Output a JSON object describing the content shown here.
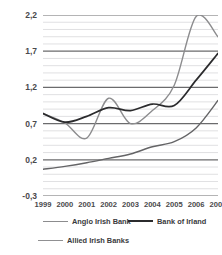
{
  "chart_data": {
    "type": "line",
    "title": "",
    "subtitle": "",
    "xlabel": "",
    "ylabel": "",
    "x": [
      1999,
      2000,
      2001,
      2002,
      2003,
      2004,
      2005,
      2006,
      2007
    ],
    "x_tick_labels": [
      "1999",
      "2000",
      "2001",
      "2002",
      "2003",
      "2004",
      "2005",
      "2006",
      "2007"
    ],
    "y_tick_labels": [
      "2,2",
      "1,7",
      "1,2",
      "0,7",
      "0,2",
      "-0,3"
    ],
    "y_tick_values": [
      2.2,
      1.7,
      1.2,
      0.7,
      0.2,
      -0.3
    ],
    "ylim": [
      -0.3,
      2.2
    ],
    "xlim": [
      1999,
      2007
    ],
    "grid": "horizontal-major-and-minor",
    "minor_grid_step": 0.1,
    "legend_position": "bottom",
    "series": [
      {
        "name": "Anglo Irish Bank",
        "color": "#8c8c8e",
        "width": 1.4,
        "values": [
          0.84,
          0.71,
          0.5,
          1.05,
          0.7,
          0.88,
          1.23,
          2.18,
          1.9
        ]
      },
      {
        "name": "Bank of Irland",
        "color": "#2b2b2d",
        "width": 1.7,
        "values": [
          0.84,
          0.72,
          0.8,
          0.92,
          0.88,
          0.97,
          0.95,
          1.3,
          1.67
        ]
      },
      {
        "name": "Allied Irish Banks",
        "color": "#646466",
        "width": 1.4,
        "values": [
          0.07,
          0.11,
          0.16,
          0.22,
          0.28,
          0.38,
          0.45,
          0.64,
          1.02
        ]
      }
    ]
  },
  "axis": {
    "y_label_0": "2,2",
    "y_label_1": "1,7",
    "y_label_2": "1,2",
    "y_label_3": "0,7",
    "y_label_4": "0,2",
    "y_label_5": "-0,3"
  },
  "legend": {
    "items": [
      {
        "label": "Anglo Irish Bank",
        "color": "#8c8c8e",
        "width": 1.6
      },
      {
        "label": "Bank of Irland",
        "color": "#2b2b2d",
        "width": 2.0
      },
      {
        "label": "Allied Irish Banks",
        "color": "#909092",
        "width": 1.4
      }
    ]
  },
  "style": {
    "background": "#ffffff",
    "major_gridline": "#6b6b6d",
    "minor_gridline": "#d8d8da",
    "text": "#4a4a4c"
  }
}
